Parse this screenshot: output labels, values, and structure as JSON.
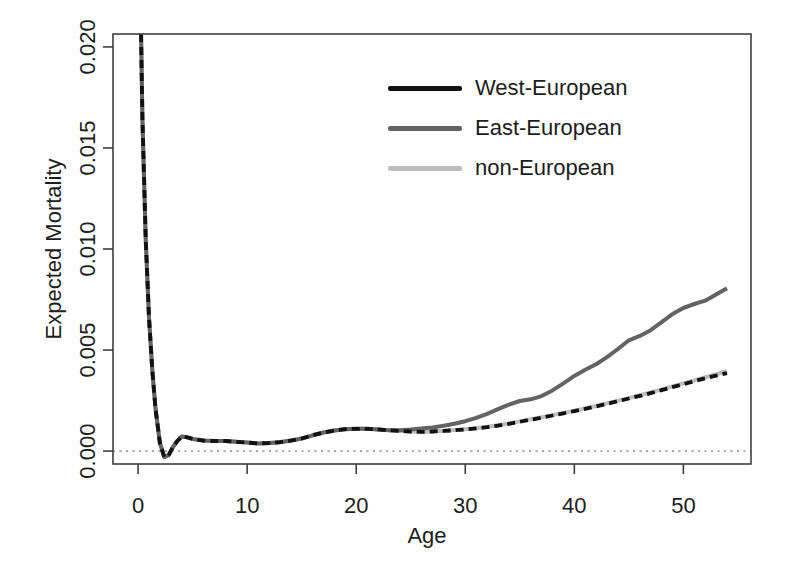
{
  "chart_data": {
    "type": "line",
    "title": "",
    "xlabel": "Age",
    "ylabel": "Expected Mortality",
    "xlim": [
      -2.3,
      56.2
    ],
    "ylim": [
      -0.00064,
      0.02064
    ],
    "x_ticks": [
      0,
      10,
      20,
      30,
      40,
      50
    ],
    "y_ticks": [
      0.0,
      0.005,
      0.01,
      0.015,
      0.02
    ],
    "y_tick_labels": [
      "0.000",
      "0.005",
      "0.010",
      "0.015",
      "0.020"
    ],
    "grid": false,
    "legend_position": "inside-top-center",
    "axis_color": "#3f3f3f",
    "text_color": "#1c1c1c",
    "reference_line": {
      "y": 0,
      "style": "dotted",
      "color": "#9a9a9a"
    },
    "x": [
      0,
      0.2,
      0.4,
      0.7,
      1,
      1.3,
      1.6,
      2,
      2.4,
      2.8,
      3.2,
      3.6,
      4,
      4.5,
      5,
      6,
      7,
      8,
      9,
      10,
      11,
      12,
      13,
      14,
      15,
      16,
      17,
      18,
      19,
      20,
      21,
      22,
      23,
      24,
      25,
      26,
      27,
      28,
      29,
      30,
      31,
      32,
      33,
      34,
      35,
      36,
      37,
      38,
      39,
      40,
      41,
      42,
      43,
      44,
      45,
      46,
      47,
      48,
      49,
      50,
      51,
      52,
      53,
      54
    ],
    "series": [
      {
        "name": "West-European",
        "color": "#111111",
        "line_style": "dashed",
        "line_width": 3.8,
        "values": [
          0.029,
          0.023,
          0.0165,
          0.0105,
          0.0066,
          0.004,
          0.0021,
          0.0004,
          -0.0003,
          -0.0002,
          0.0002,
          0.0005,
          0.00072,
          0.00068,
          0.0006,
          0.00052,
          0.0005,
          0.0005,
          0.00046,
          0.00042,
          0.00038,
          0.0004,
          0.00044,
          0.00052,
          0.00062,
          0.00078,
          0.00092,
          0.00102,
          0.00108,
          0.0011,
          0.0011,
          0.00107,
          0.00103,
          0.001,
          0.00097,
          0.00095,
          0.00097,
          0.001,
          0.00103,
          0.00107,
          0.00112,
          0.00118,
          0.00126,
          0.00135,
          0.00145,
          0.00155,
          0.00165,
          0.00176,
          0.00187,
          0.00198,
          0.00209,
          0.00221,
          0.00234,
          0.00247,
          0.0026,
          0.00273,
          0.00287,
          0.00301,
          0.00316,
          0.00331,
          0.00346,
          0.0036,
          0.00373,
          0.00386
        ]
      },
      {
        "name": "East-European",
        "color": "#636363",
        "line_style": "solid",
        "line_width": 4,
        "values": [
          0.029,
          0.023,
          0.0165,
          0.0105,
          0.0066,
          0.004,
          0.0021,
          0.0004,
          -0.0003,
          -0.0002,
          0.0002,
          0.0005,
          0.00072,
          0.00068,
          0.0006,
          0.00052,
          0.0005,
          0.0005,
          0.00046,
          0.00042,
          0.00038,
          0.0004,
          0.00044,
          0.00052,
          0.00062,
          0.00078,
          0.00092,
          0.00102,
          0.00108,
          0.0011,
          0.0011,
          0.00107,
          0.00103,
          0.00103,
          0.00106,
          0.00111,
          0.00117,
          0.00125,
          0.00135,
          0.00148,
          0.00164,
          0.00184,
          0.00207,
          0.0023,
          0.00248,
          0.00256,
          0.00272,
          0.003,
          0.00335,
          0.00372,
          0.00402,
          0.0043,
          0.00465,
          0.00505,
          0.00548,
          0.0057,
          0.00598,
          0.00638,
          0.00678,
          0.00708,
          0.00728,
          0.00744,
          0.00775,
          0.00806
        ]
      },
      {
        "name": "non-European",
        "color": "#bdbdbd",
        "line_style": "solid",
        "line_width": 4,
        "values": [
          0.029,
          0.023,
          0.0165,
          0.0105,
          0.0066,
          0.004,
          0.0021,
          0.0004,
          -0.0003,
          -0.0002,
          0.0002,
          0.0005,
          0.00072,
          0.00068,
          0.0006,
          0.00052,
          0.0005,
          0.0005,
          0.00046,
          0.00042,
          0.00038,
          0.0004,
          0.00044,
          0.00052,
          0.00062,
          0.00078,
          0.00092,
          0.00102,
          0.00108,
          0.0011,
          0.0011,
          0.00107,
          0.00103,
          0.001,
          0.00097,
          0.00095,
          0.00097,
          0.001,
          0.00104,
          0.00108,
          0.00113,
          0.0012,
          0.00128,
          0.00137,
          0.00147,
          0.00157,
          0.00167,
          0.00178,
          0.00189,
          0.002,
          0.00211,
          0.00223,
          0.00236,
          0.00249,
          0.00262,
          0.00276,
          0.0029,
          0.00305,
          0.0032,
          0.00335,
          0.0035,
          0.00365,
          0.0038,
          0.00396
        ]
      }
    ]
  }
}
